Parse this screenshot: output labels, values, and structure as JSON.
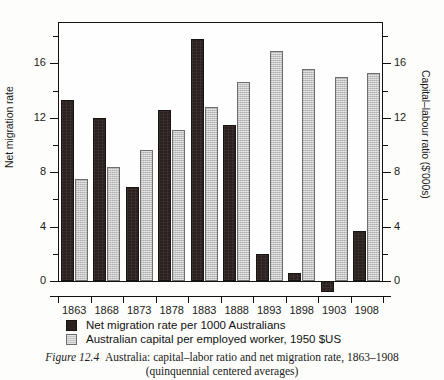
{
  "chart_data": {
    "type": "bar",
    "title": "Australia: capital–labor ratio and net migration rate, 1863–1908",
    "subtitle": "(quinquennial centered averages)",
    "figure_number": "Figure 12.4",
    "xlabel": "",
    "ylabel": "Net migration rate",
    "ylabel_secondary": "Capital–labour ratio ($'000s)",
    "categories": [
      "1863",
      "1868",
      "1873",
      "1878",
      "1883",
      "1888",
      "1893",
      "1898",
      "1903",
      "1908"
    ],
    "ylim": [
      -1,
      19
    ],
    "yticks": [
      0,
      4,
      8,
      12,
      16
    ],
    "yticks_minor": [
      2,
      6,
      10,
      14,
      18
    ],
    "y2lim": [
      -1,
      19
    ],
    "y2ticks": [
      0,
      4,
      8,
      12,
      16
    ],
    "grid": false,
    "legend_position": "below-axes",
    "series": [
      {
        "name": "Net migration rate per 1000 Australians",
        "axis": "left",
        "color": "#2b2220",
        "values": [
          13.3,
          12.0,
          6.9,
          12.6,
          17.8,
          11.5,
          2.0,
          0.6,
          -0.8,
          3.7
        ]
      },
      {
        "name": "Australian capital per employed worker, 1950 $US",
        "axis": "right",
        "color": "#c3c3c3",
        "values": [
          7.5,
          8.4,
          9.6,
          11.1,
          12.8,
          14.6,
          16.9,
          15.6,
          15.0,
          15.3
        ]
      }
    ]
  },
  "axes": {
    "left_title": "Net migration rate",
    "right_title": "Capital–labour ratio ($'000s)",
    "left_ticks": [
      "16",
      "12",
      "8",
      "4",
      "0"
    ],
    "right_ticks": [
      "16",
      "12",
      "8",
      "4",
      "0"
    ]
  },
  "legend": {
    "items": [
      {
        "label": "Net migration rate per 1000 Australians",
        "swatch": "dark"
      },
      {
        "label": "Australian capital per employed worker, 1950 $US",
        "swatch": "light"
      }
    ]
  },
  "caption": {
    "figure_number": "Figure 12.4",
    "line1": "Australia: capital–labor ratio and net migration rate, 1863–1908",
    "line2": "(quinquennial centered averages)"
  }
}
